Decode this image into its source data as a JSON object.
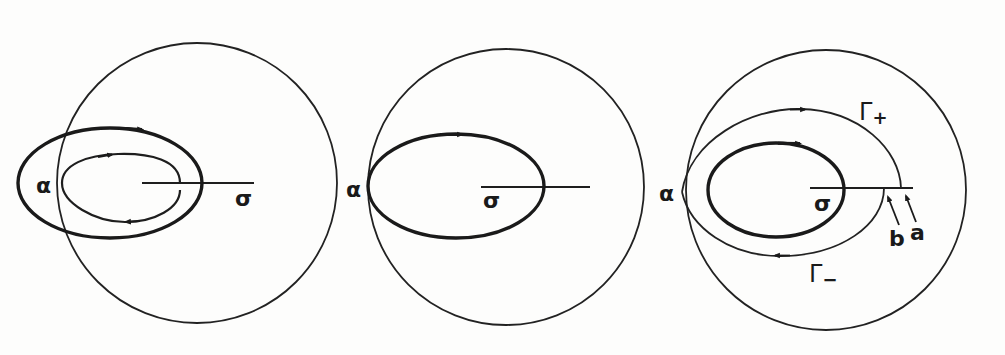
{
  "figure": {
    "panels": [
      {
        "id": "panel-1",
        "labels": {
          "alpha": "α",
          "sigma": "σ"
        },
        "curves": [
          "outer thick closed contour (clockwise arrows)",
          "inner thin keyhole contour"
        ]
      },
      {
        "id": "panel-2",
        "labels": {
          "alpha": "α",
          "sigma": "σ"
        },
        "curves": [
          "thick closed contour tangent to circle at alpha"
        ]
      },
      {
        "id": "panel-3",
        "labels": {
          "alpha": "α",
          "sigma": "σ",
          "gamma_plus": "Γ",
          "gamma_plus_sub": "+",
          "gamma_minus": "Γ",
          "gamma_minus_sub": "−",
          "b": "b",
          "a": "a"
        },
        "curves": [
          "thick closed contour around sigma",
          "thin contour Γ+ from alpha to a",
          "thin contour Γ− from b to alpha"
        ]
      }
    ]
  },
  "colors": {
    "ink": "#1a1a1a",
    "paper": "#fdfdfc"
  }
}
